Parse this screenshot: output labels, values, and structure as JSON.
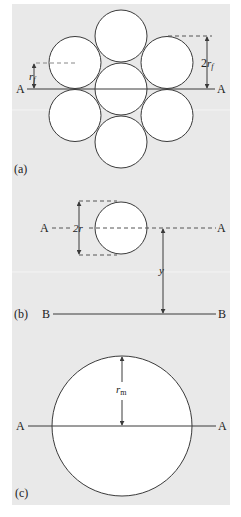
{
  "colors": {
    "background": "#e9e9e9",
    "circle_fill": "#ffffff",
    "stroke": "#3a3a3a"
  },
  "panel_a": {
    "tag": "(a)",
    "axis_left": "A",
    "axis_right": "A",
    "dim_small": {
      "base": "r",
      "sub": "f"
    },
    "dim_large": {
      "prefix": "2",
      "base": "r",
      "sub": "f"
    }
  },
  "panel_b": {
    "tag": "(b)",
    "axis_a_left": "A",
    "axis_a_right": "A",
    "axis_b_left": "B",
    "axis_b_right": "B",
    "dim_diameter": "2r",
    "dim_distance": "y"
  },
  "panel_c": {
    "tag": "(c)",
    "axis_left": "A",
    "axis_right": "A",
    "dim_radius": {
      "base": "r",
      "sub": "m"
    }
  }
}
